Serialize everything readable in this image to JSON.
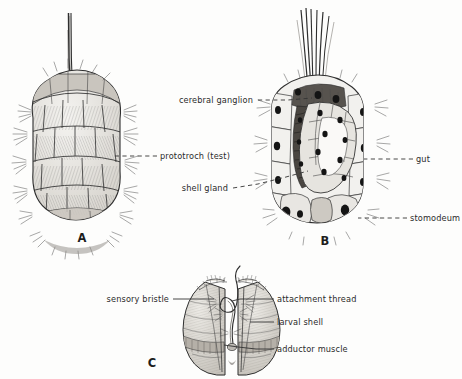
{
  "figure": {
    "background_color": "#fdfdfc",
    "ink_color": "#2e2e2e",
    "panels": [
      {
        "id": "A",
        "letter": "A",
        "caption": "",
        "x": 82,
        "y": 242,
        "description": "ciliated larva with apical tuft, lateral view"
      },
      {
        "id": "B",
        "letter": "B",
        "caption": "",
        "x": 325,
        "y": 245,
        "description": "sagittal section of larva showing internal organs"
      },
      {
        "id": "C",
        "letter": "C",
        "caption": "",
        "x": 152,
        "y": 367,
        "description": "bivalved larval shell with attachment thread"
      }
    ],
    "labels": [
      {
        "id": "cerebral-ganglion",
        "text": "cerebral ganglion",
        "text_x": 253,
        "text_y": 103,
        "anchor": "end",
        "leader": "dashed",
        "leader_points": "258,100 272,100 288,100 312,98",
        "panel": "B"
      },
      {
        "id": "prototroch-test",
        "text": "prototroch (test)",
        "text_x": 160,
        "text_y": 159,
        "anchor": "start",
        "leader": "dashed",
        "leader_points": "157,156 140,156 122,156 112,156",
        "panel": "A"
      },
      {
        "id": "shell-gland",
        "text": "shell gland",
        "text_x": 228,
        "text_y": 191,
        "anchor": "end",
        "leader": "dashed",
        "leader_points": "233,188 258,184 286,177 308,171",
        "panel": "B"
      },
      {
        "id": "gut",
        "text": "gut",
        "text_x": 416,
        "text_y": 162,
        "anchor": "start",
        "leader": "dashed",
        "leader_points": "413,159 398,159 380,159 364,159",
        "panel": "B"
      },
      {
        "id": "stomodeum",
        "text": "stomodeum",
        "text_x": 410,
        "text_y": 221,
        "anchor": "start",
        "leader": "dashed",
        "leader_points": "407,218 392,218 376,218 358,218",
        "panel": "B"
      },
      {
        "id": "sensory-bristle",
        "text": "sensory bristle",
        "text_x": 169,
        "text_y": 302,
        "anchor": "end",
        "leader": "solid",
        "leader_points": "173,299 200,299 214,299",
        "panel": "C"
      },
      {
        "id": "attachment-thread",
        "text": "attachment thread",
        "text_x": 277,
        "text_y": 302,
        "anchor": "start",
        "leader": "solid",
        "leader_points": "274,299 256,299 240,299 232,301",
        "panel": "C"
      },
      {
        "id": "larval-shell",
        "text": "larval shell",
        "text_x": 277,
        "text_y": 325,
        "anchor": "start",
        "leader": "solid",
        "leader_points": "274,322 262,322 250,322",
        "panel": "C"
      },
      {
        "id": "adductor-muscle",
        "text": "adductor muscle",
        "text_x": 277,
        "text_y": 352,
        "anchor": "start",
        "leader": "solid",
        "leader_points": "274,349 256,349 238,347 224,345",
        "panel": "C"
      }
    ]
  }
}
